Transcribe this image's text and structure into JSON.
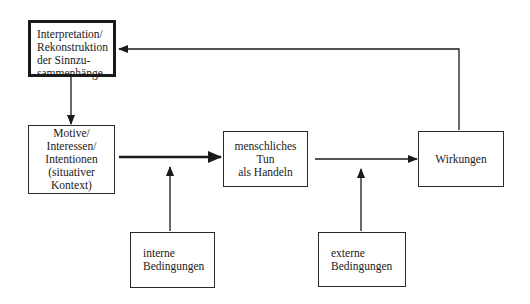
{
  "diagram": {
    "boxes": {
      "interpretation": {
        "lines": [
          "Interpretation/",
          "Rekonstruktion",
          "der Sinnzu-",
          "sammenhänge"
        ]
      },
      "motive": {
        "lines": [
          "Motive/",
          "Interessen/",
          "Intentionen",
          "(situativer",
          "Kontext)"
        ]
      },
      "handeln": {
        "lines": [
          "menschliches",
          "Tun",
          "als Handeln"
        ]
      },
      "wirkungen": {
        "lines": [
          "Wirkungen"
        ]
      },
      "interne": {
        "lines": [
          "interne",
          "Bedingungen"
        ]
      },
      "externe": {
        "lines": [
          "externe",
          "Bedingungen"
        ]
      }
    },
    "edges": [
      {
        "from": "interpretation",
        "to": "motive",
        "style": "normal"
      },
      {
        "from": "motive",
        "to": "handeln",
        "style": "thick"
      },
      {
        "from": "handeln",
        "to": "wirkungen",
        "style": "normal"
      },
      {
        "from": "interne",
        "to": "motive-handeln-arrow",
        "style": "normal"
      },
      {
        "from": "externe",
        "to": "handeln-wirkungen-arrow",
        "style": "normal"
      },
      {
        "from": "wirkungen",
        "to": "interpretation",
        "style": "feedback"
      }
    ],
    "colors": {
      "stroke": "#1a1a1a",
      "background": "#ffffff"
    }
  }
}
